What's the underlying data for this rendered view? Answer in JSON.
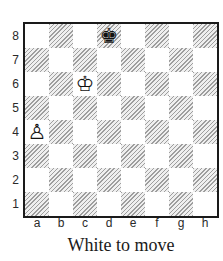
{
  "board": {
    "files": [
      "a",
      "b",
      "c",
      "d",
      "e",
      "f",
      "g",
      "h"
    ],
    "ranks": [
      "8",
      "7",
      "6",
      "5",
      "4",
      "3",
      "2",
      "1"
    ],
    "pieces": [
      {
        "square": "d8",
        "color": "black",
        "type": "king",
        "glyph": "♚"
      },
      {
        "square": "c6",
        "color": "white",
        "type": "king",
        "glyph": "♔"
      },
      {
        "square": "a4",
        "color": "white",
        "type": "pawn",
        "glyph": "♙"
      }
    ]
  },
  "caption": "White to move",
  "colors": {
    "light_square": "#ffffff",
    "dark_square_hatch": "#9e9e9e",
    "board_border": "#1a1a1a",
    "label_text": "#2a2a2a",
    "caption_text": "#1a1a1a"
  }
}
